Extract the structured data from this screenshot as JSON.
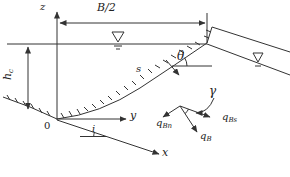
{
  "figure": {
    "colors": {
      "line": "#333333",
      "background": "#ffffff",
      "text": "#222222"
    },
    "axes": {
      "vertical": "z",
      "lateral": "y",
      "streamwise": "x",
      "origin": "0"
    },
    "dimensions": {
      "half_width": "B/2",
      "center_depth": {
        "base": "h",
        "sub": "c"
      }
    },
    "coordinates": {
      "bank_arc": "s"
    },
    "angles": {
      "bank_inclination": "θ",
      "bed_slope": "i",
      "bedload_deviation": "γ"
    },
    "bedload_vectors": {
      "lateral": {
        "base": "q",
        "sub": "Bn"
      },
      "streamwise": {
        "base": "q",
        "sub": "Bs"
      },
      "resultant": {
        "base": "q",
        "sub": "B"
      }
    },
    "icons": {
      "water_surface_marker": "∇"
    }
  }
}
